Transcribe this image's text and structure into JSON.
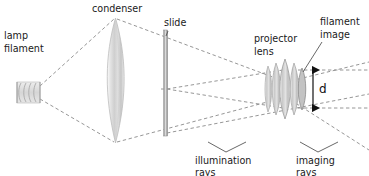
{
  "figure": {
    "background_color": "#ffffff",
    "width": 369,
    "height": 176
  },
  "labels": {
    "lamp_line1": "lamp",
    "lamp_line2": "filament",
    "condenser": "condenser",
    "slide": "slide",
    "projector_line1": "projector",
    "projector_line2": "lens",
    "filament_image_line1": "filament",
    "filament_image_line2": "image",
    "dimension_d": "d",
    "illumination_line1": "illumination",
    "illumination_line2": "rays",
    "imaging_line1": "imaging",
    "imaging_line2": "rays"
  },
  "components": {
    "lamp_filament": {
      "name": "lamp-filament",
      "coil_turns": 4,
      "x": 17,
      "y": 82,
      "width": 23,
      "height": 21
    },
    "condenser_lens": {
      "name": "condenser-lens",
      "type": "biconvex",
      "center_x": 115.5,
      "top_y": 18,
      "bottom_y": 143,
      "max_width": 25
    },
    "slide": {
      "name": "slide",
      "x": 164,
      "top_y": 30,
      "bottom_y": 136,
      "thickness": 4
    },
    "projector_lens": {
      "name": "projector-lens-group",
      "type": "compound",
      "center_x": 285,
      "center_y": 89,
      "width": 42,
      "height": 54,
      "elements": 5
    },
    "filament_image": {
      "name": "filament-image",
      "x": 299,
      "center_y": 89
    }
  },
  "colors": {
    "ray_dashed": "#8a8a8a",
    "leader_line": "#4d4d4d",
    "text": "#1a1a1a",
    "glass_light": "#f2f2f2",
    "glass_mid": "#d4d4d4",
    "glass_dark": "#b0b0b0",
    "arrow": "#111111"
  },
  "ray_groups": {
    "illumination": {
      "label": "illumination rays",
      "style": "dashed",
      "description": "Rays from the lamp filament expand to fill the condenser, then converge through the slide toward the projector lens, forming the filament image."
    },
    "imaging": {
      "label": "imaging rays",
      "style": "dashed",
      "description": "Rays from points on the slide pass through the projector lens aperture of diameter d and continue to the screen."
    }
  }
}
